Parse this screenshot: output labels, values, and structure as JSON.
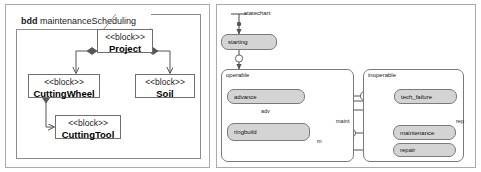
{
  "figure": {
    "panels": 2,
    "left_panel_name": "block-definition-diagram",
    "right_panel_name": "state-machine-diagram"
  },
  "bdd": {
    "frame_keyword": "bdd",
    "frame_title": "maintenanceScheduling",
    "stereotype": "<<block>>",
    "blocks": [
      {
        "id": "project",
        "name": "Project"
      },
      {
        "id": "cuttingwheel",
        "name": "CuttingWheel"
      },
      {
        "id": "soil",
        "name": "Soil"
      },
      {
        "id": "cuttingtool",
        "name": "CuttingTool"
      }
    ],
    "compositions": [
      {
        "from": "Project",
        "to": "CuttingWheel"
      },
      {
        "from": "Project",
        "to": "Soil"
      },
      {
        "from": "CuttingWheel",
        "to": "CuttingTool"
      }
    ]
  },
  "statechart": {
    "title": "statechart",
    "initial_state_name": "initial-pseudostate",
    "states": [
      {
        "id": "starting",
        "name": "starting"
      },
      {
        "id": "advance",
        "name": "advance"
      },
      {
        "id": "ringbuild",
        "name": "ringbuild"
      },
      {
        "id": "tech_failure",
        "name": "tech_failure"
      },
      {
        "id": "maintenance",
        "name": "maintenance"
      },
      {
        "id": "repair",
        "name": "repair"
      }
    ],
    "regions": [
      {
        "id": "operable",
        "label": "operable"
      },
      {
        "id": "inoperable",
        "label": "inoperable"
      }
    ],
    "transition_labels": [
      {
        "id": "adv",
        "text": "adv"
      },
      {
        "id": "maint",
        "text": "maint"
      },
      {
        "id": "rep",
        "text": "rep"
      },
      {
        "id": "m",
        "text": "m"
      }
    ],
    "pseudostates": [
      {
        "id": "history",
        "glyph": "H"
      },
      {
        "id": "choice",
        "glyph": "diamond"
      },
      {
        "id": "final",
        "glyph": "bullseye"
      }
    ],
    "colors": {
      "state_fill": "#d4d4d4",
      "line": "#555555",
      "border": "#7a7a7a",
      "panel_border": "#aaaaaa",
      "background": "#ffffff"
    }
  }
}
